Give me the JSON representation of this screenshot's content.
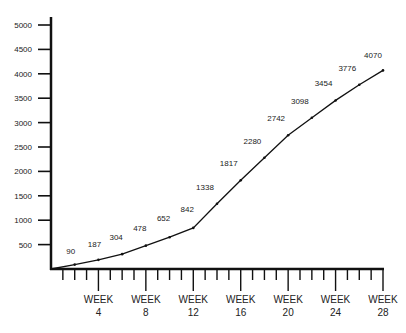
{
  "chart_data": {
    "type": "line",
    "title": "",
    "xlabel": "",
    "ylabel": "",
    "x": [
      0,
      2,
      4,
      6,
      8,
      10,
      12,
      14,
      16,
      18,
      20,
      22,
      24,
      26,
      28
    ],
    "values": [
      0,
      90,
      187,
      304,
      478,
      652,
      842,
      1338,
      1817,
      2280,
      2742,
      3098,
      3454,
      3776,
      4070
    ],
    "data_labels": [
      "90",
      "187",
      "304",
      "478",
      "652",
      "842",
      "1338",
      "1817",
      "2280",
      "2742",
      "3098",
      "3454",
      "3776",
      "4070"
    ],
    "y_ticks": [
      500,
      1000,
      1500,
      2000,
      2500,
      3000,
      3500,
      4000,
      4500,
      5000
    ],
    "y_tick_labels": [
      "500",
      "1000",
      "1500",
      "2000",
      "2500",
      "3000",
      "3500",
      "4000",
      "4500",
      "5000"
    ],
    "x_major_ticks": [
      4,
      8,
      12,
      16,
      20,
      24,
      28
    ],
    "x_tick_labels": [
      {
        "line1": "WEEK",
        "line2": "4"
      },
      {
        "line1": "WEEK",
        "line2": "8"
      },
      {
        "line1": "WEEK",
        "line2": "12"
      },
      {
        "line1": "WEEK",
        "line2": "16"
      },
      {
        "line1": "WEEK",
        "line2": "20"
      },
      {
        "line1": "WEEK",
        "line2": "24"
      },
      {
        "line1": "WEEK",
        "line2": "28"
      }
    ],
    "x_minor_tick_every": 1,
    "xlim": [
      0,
      28
    ],
    "ylim": [
      0,
      5000
    ],
    "grid": false,
    "legend": null,
    "line_color": "#111111"
  }
}
